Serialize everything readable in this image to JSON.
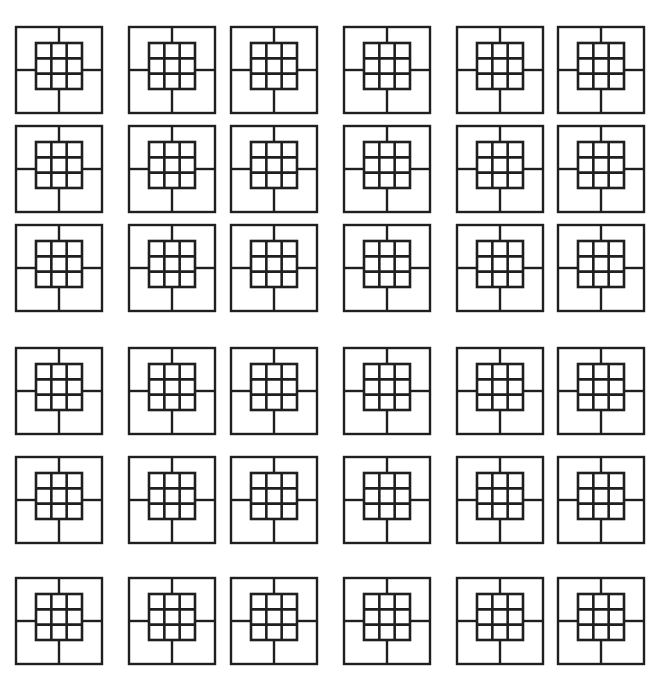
{
  "document": {
    "title": "Tiled Nested Square Motif Pattern",
    "background_color": "#ffffff",
    "stroke_color": "#1f1f1f",
    "canvas_width": 661,
    "canvas_height": 683
  },
  "pattern": {
    "description": "Repeating ornamental tile: outer square frame with a four-armed cross joining the frame to a central nested 3x3 grid of squares",
    "columns": 6,
    "rows": 6,
    "tile_count": 36,
    "tile_width": 90,
    "tile_height": 90,
    "column_x": [
      14,
      127,
      229,
      342,
      455,
      556
    ],
    "row_y": [
      25,
      124,
      223,
      346,
      455,
      576
    ],
    "row_group_gap": 25,
    "motif": {
      "outer_frame_inset": 2,
      "outer_frame_size": 86,
      "inner_frame_x": 22,
      "inner_frame_y": 18,
      "inner_frame_size": 46,
      "inner_divisions": 3,
      "cross_arm_top_x": 45,
      "cross_arm_left_y": 45,
      "stroke_width_outer": 2.4,
      "stroke_width_inner": 2.6
    }
  },
  "tiles": [
    {
      "id": "tile-r1c1",
      "row": 1,
      "col": 1,
      "x": 14,
      "y": 25
    },
    {
      "id": "tile-r1c2",
      "row": 1,
      "col": 2,
      "x": 127,
      "y": 25
    },
    {
      "id": "tile-r1c3",
      "row": 1,
      "col": 3,
      "x": 229,
      "y": 25
    },
    {
      "id": "tile-r1c4",
      "row": 1,
      "col": 4,
      "x": 342,
      "y": 25
    },
    {
      "id": "tile-r1c5",
      "row": 1,
      "col": 5,
      "x": 455,
      "y": 25
    },
    {
      "id": "tile-r1c6",
      "row": 1,
      "col": 6,
      "x": 556,
      "y": 25
    },
    {
      "id": "tile-r2c1",
      "row": 2,
      "col": 1,
      "x": 14,
      "y": 124
    },
    {
      "id": "tile-r2c2",
      "row": 2,
      "col": 2,
      "x": 127,
      "y": 124
    },
    {
      "id": "tile-r2c3",
      "row": 2,
      "col": 3,
      "x": 229,
      "y": 124
    },
    {
      "id": "tile-r2c4",
      "row": 2,
      "col": 4,
      "x": 342,
      "y": 124
    },
    {
      "id": "tile-r2c5",
      "row": 2,
      "col": 5,
      "x": 455,
      "y": 124
    },
    {
      "id": "tile-r2c6",
      "row": 2,
      "col": 6,
      "x": 556,
      "y": 124
    },
    {
      "id": "tile-r3c1",
      "row": 3,
      "col": 1,
      "x": 14,
      "y": 223
    },
    {
      "id": "tile-r3c2",
      "row": 3,
      "col": 2,
      "x": 127,
      "y": 223
    },
    {
      "id": "tile-r3c3",
      "row": 3,
      "col": 3,
      "x": 229,
      "y": 223
    },
    {
      "id": "tile-r3c4",
      "row": 3,
      "col": 4,
      "x": 342,
      "y": 223
    },
    {
      "id": "tile-r3c5",
      "row": 3,
      "col": 5,
      "x": 455,
      "y": 223
    },
    {
      "id": "tile-r3c6",
      "row": 3,
      "col": 6,
      "x": 556,
      "y": 223
    },
    {
      "id": "tile-r4c1",
      "row": 4,
      "col": 1,
      "x": 14,
      "y": 346
    },
    {
      "id": "tile-r4c2",
      "row": 4,
      "col": 2,
      "x": 127,
      "y": 346
    },
    {
      "id": "tile-r4c3",
      "row": 4,
      "col": 3,
      "x": 229,
      "y": 346
    },
    {
      "id": "tile-r4c4",
      "row": 4,
      "col": 4,
      "x": 342,
      "y": 346
    },
    {
      "id": "tile-r4c5",
      "row": 4,
      "col": 5,
      "x": 455,
      "y": 346
    },
    {
      "id": "tile-r4c6",
      "row": 4,
      "col": 6,
      "x": 556,
      "y": 346
    },
    {
      "id": "tile-r5c1",
      "row": 5,
      "col": 1,
      "x": 14,
      "y": 455
    },
    {
      "id": "tile-r5c2",
      "row": 5,
      "col": 2,
      "x": 127,
      "y": 455
    },
    {
      "id": "tile-r5c3",
      "row": 5,
      "col": 3,
      "x": 229,
      "y": 455
    },
    {
      "id": "tile-r5c4",
      "row": 5,
      "col": 4,
      "x": 342,
      "y": 455
    },
    {
      "id": "tile-r5c5",
      "row": 5,
      "col": 5,
      "x": 455,
      "y": 455
    },
    {
      "id": "tile-r5c6",
      "row": 5,
      "col": 6,
      "x": 556,
      "y": 455
    },
    {
      "id": "tile-r6c1",
      "row": 6,
      "col": 1,
      "x": 14,
      "y": 576
    },
    {
      "id": "tile-r6c2",
      "row": 6,
      "col": 2,
      "x": 127,
      "y": 576
    },
    {
      "id": "tile-r6c3",
      "row": 6,
      "col": 3,
      "x": 229,
      "y": 576
    },
    {
      "id": "tile-r6c4",
      "row": 6,
      "col": 4,
      "x": 342,
      "y": 576
    },
    {
      "id": "tile-r6c5",
      "row": 6,
      "col": 5,
      "x": 455,
      "y": 576
    },
    {
      "id": "tile-r6c6",
      "row": 6,
      "col": 6,
      "x": 556,
      "y": 576
    }
  ]
}
